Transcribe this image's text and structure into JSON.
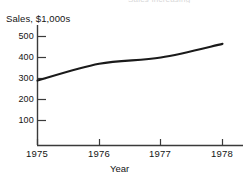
{
  "clipped_header": {
    "text": "Sales Increasing"
  },
  "chart_data": {
    "type": "line",
    "title": "",
    "xlabel": "Year",
    "ylabel": "Sales, $1,000s",
    "x": [
      1975,
      1976,
      1977,
      1978
    ],
    "values": [
      290,
      370,
      400,
      465
    ],
    "series": [
      {
        "name": "Sales",
        "values": [
          290,
          370,
          400,
          465
        ],
        "color": "#1a1a1a"
      }
    ],
    "xlim": [
      1975,
      1978
    ],
    "ylim": [
      0,
      550
    ],
    "x_tick_labels": [
      "1975",
      "1976",
      "1977",
      "1978"
    ],
    "y_tick_labels": [
      "100",
      "200",
      "300",
      "400",
      "500"
    ],
    "y_tick_values": [
      100,
      200,
      300,
      400,
      500
    ],
    "grid": false,
    "legend": "none",
    "line_color": "#1a1a1a",
    "axis_color": "#3a3a3a",
    "background": "#ffffff"
  },
  "axes": {
    "y_title": "Sales, $1,000s",
    "x_title": "Year",
    "y_ticks": [
      {
        "label": "500",
        "top": 31
      },
      {
        "label": "400",
        "top": 52
      },
      {
        "label": "300",
        "top": 73
      },
      {
        "label": "200",
        "top": 94
      },
      {
        "label": "100",
        "top": 115
      }
    ],
    "x_ticks": [
      {
        "label": "1975",
        "left": 17
      },
      {
        "label": "1976",
        "left": 79
      },
      {
        "label": "1977",
        "left": 140
      },
      {
        "label": "1978",
        "left": 202
      }
    ]
  }
}
